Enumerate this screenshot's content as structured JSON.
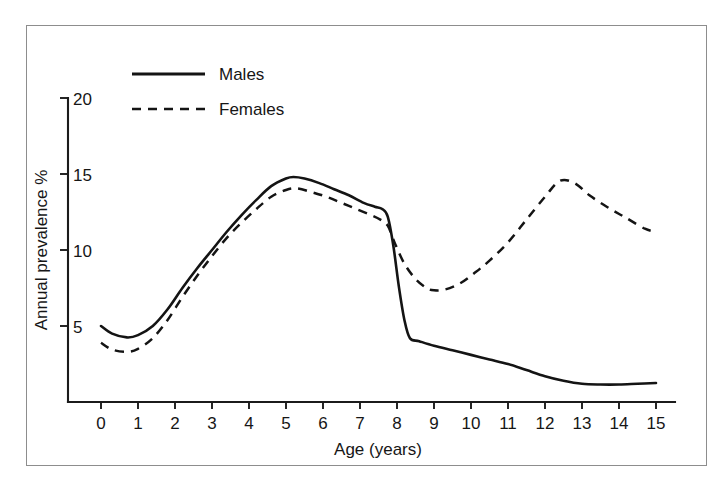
{
  "chart_data": {
    "type": "line",
    "title": "",
    "xlabel": "Age (years)",
    "ylabel": "Annual prevalence %",
    "xlim": [
      -0.45,
      15.55
    ],
    "ylim": [
      0,
      20
    ],
    "xticks": [
      "0",
      "1",
      "2",
      "3",
      "4",
      "5",
      "6",
      "7",
      "8",
      "9",
      "10",
      "11",
      "12",
      "13",
      "14",
      "15"
    ],
    "yticks": [
      "5",
      "10",
      "15",
      "20"
    ],
    "grid": false,
    "legend_position": "top-left-inside",
    "series": [
      {
        "name": "Males",
        "style": "solid",
        "x": [
          0,
          0.3,
          0.7,
          1.0,
          1.4,
          1.8,
          2.2,
          2.6,
          3.0,
          3.4,
          3.8,
          4.2,
          4.6,
          5.0,
          5.2,
          5.5,
          5.9,
          6.3,
          6.7,
          7.1,
          7.4,
          7.6,
          7.75,
          7.9,
          8.05,
          8.2,
          8.35,
          8.6,
          9.0,
          9.5,
          10.0,
          10.5,
          11.0,
          11.5,
          12.0,
          12.5,
          13.0,
          13.5,
          14.0,
          14.5,
          15.0
        ],
        "y": [
          5.0,
          4.5,
          4.25,
          4.4,
          5.0,
          6.1,
          7.5,
          8.8,
          10.0,
          11.2,
          12.3,
          13.3,
          14.2,
          14.7,
          14.8,
          14.7,
          14.4,
          14.0,
          13.6,
          13.1,
          12.85,
          12.7,
          12.2,
          10.3,
          7.6,
          5.4,
          4.2,
          4.0,
          3.7,
          3.4,
          3.1,
          2.8,
          2.5,
          2.1,
          1.7,
          1.4,
          1.2,
          1.15,
          1.15,
          1.2,
          1.25
        ]
      },
      {
        "name": "Females",
        "style": "dashed",
        "x": [
          0,
          0.3,
          0.7,
          1.0,
          1.4,
          1.8,
          2.2,
          2.6,
          3.0,
          3.4,
          3.8,
          4.2,
          4.6,
          5.0,
          5.3,
          5.7,
          6.1,
          6.5,
          6.9,
          7.3,
          7.55,
          7.75,
          7.95,
          8.2,
          8.5,
          8.8,
          9.0,
          9.3,
          9.7,
          10.1,
          10.5,
          11.0,
          11.5,
          12.0,
          12.4,
          12.8,
          13.2,
          13.7,
          14.2,
          14.7,
          15.0
        ],
        "y": [
          3.9,
          3.45,
          3.3,
          3.5,
          4.2,
          5.4,
          6.9,
          8.3,
          9.6,
          10.8,
          11.8,
          12.7,
          13.5,
          13.95,
          14.05,
          13.8,
          13.5,
          13.1,
          12.7,
          12.3,
          12.0,
          11.6,
          10.4,
          9.1,
          8.1,
          7.5,
          7.35,
          7.4,
          7.8,
          8.5,
          9.3,
          10.5,
          12.0,
          13.5,
          14.55,
          14.4,
          13.6,
          12.8,
          12.1,
          11.4,
          11.2
        ]
      }
    ],
    "annotations": []
  },
  "legend": {
    "items": [
      {
        "label": "Males",
        "style": "solid"
      },
      {
        "label": "Females",
        "style": "dashed"
      }
    ]
  },
  "axes": {
    "x_title": "Age (years)",
    "y_title": "Annual prevalence %",
    "x_tick_labels": [
      "0",
      "1",
      "2",
      "3",
      "4",
      "5",
      "6",
      "7",
      "8",
      "9",
      "10",
      "11",
      "12",
      "13",
      "14",
      "15"
    ],
    "y_tick_labels": [
      "20",
      "15",
      "10",
      "5"
    ]
  },
  "colors": {
    "ink": "#141414",
    "frame": "#8d8d8d",
    "background": "#ffffff"
  },
  "caption": {
    "text": ""
  }
}
